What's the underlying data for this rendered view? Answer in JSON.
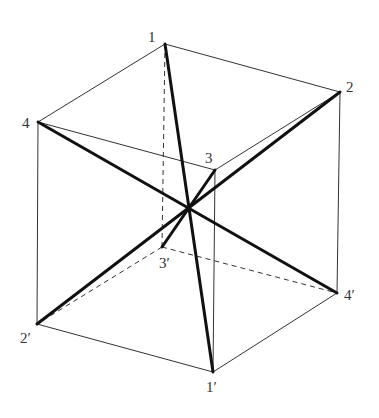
{
  "diagram": {
    "type": "cube-body-diagonals",
    "vertices": {
      "v1": {
        "label": "1",
        "x": 165,
        "y": 44,
        "lx": 148,
        "ly": 42
      },
      "v2": {
        "label": "2",
        "x": 340,
        "y": 92,
        "lx": 346,
        "ly": 92
      },
      "v3": {
        "label": "3",
        "x": 215,
        "y": 170,
        "lx": 205,
        "ly": 163
      },
      "v4": {
        "label": "4",
        "x": 38,
        "y": 122,
        "lx": 22,
        "ly": 128
      },
      "v1p": {
        "label": "1′",
        "x": 213,
        "y": 372,
        "lx": 206,
        "ly": 392
      },
      "v2p": {
        "label": "2′",
        "x": 37,
        "y": 324,
        "lx": 20,
        "ly": 343
      },
      "v3p": {
        "label": "3′",
        "x": 162,
        "y": 247,
        "lx": 159,
        "ly": 268
      },
      "v4p": {
        "label": "4′",
        "x": 337,
        "y": 293,
        "lx": 344,
        "ly": 300
      }
    },
    "center": {
      "x": 190,
      "y": 208
    },
    "visible_edges": [
      [
        "v1",
        "v2"
      ],
      [
        "v1",
        "v4"
      ],
      [
        "v2",
        "v3"
      ],
      [
        "v3",
        "v4"
      ],
      [
        "v4",
        "v2p"
      ],
      [
        "v2",
        "v4p"
      ],
      [
        "v3",
        "v1p"
      ],
      [
        "v2p",
        "v1p"
      ],
      [
        "v1p",
        "v4p"
      ]
    ],
    "hidden_edges": [
      [
        "v1",
        "v3p"
      ],
      [
        "v3p",
        "v2p"
      ],
      [
        "v3p",
        "v4p"
      ]
    ],
    "body_diagonals": [
      [
        "v1",
        "v1p"
      ],
      [
        "v2",
        "v2p"
      ],
      [
        "v3",
        "v3p"
      ],
      [
        "v4",
        "v4p"
      ]
    ],
    "colors": {
      "line": "#333333",
      "diagonal": "#111111",
      "background": "#ffffff"
    }
  }
}
